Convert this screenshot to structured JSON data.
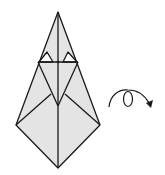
{
  "diagram": {
    "type": "origami-fold-step",
    "fill_color": "#e4e4e4",
    "line_color": "#1a1a1a",
    "symbols": [
      {
        "name": "turn-over-arrow",
        "meaning": "turn model over"
      }
    ]
  }
}
